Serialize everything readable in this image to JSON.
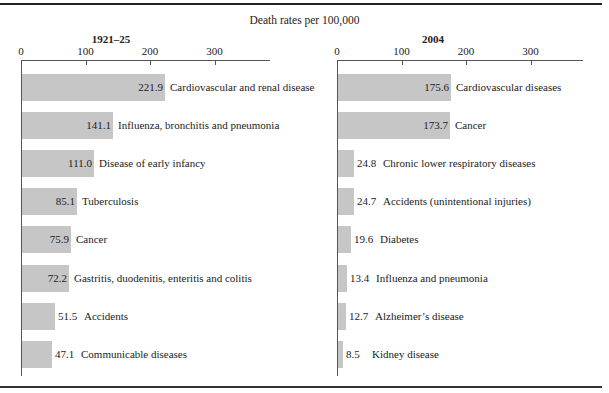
{
  "super_title": "Death rates per 100,000",
  "chart_data": [
    {
      "type": "bar",
      "orientation": "horizontal",
      "title": "1921–25",
      "xlabel": "Death rates per 100,000",
      "ylabel": "",
      "xlim": [
        0,
        380
      ],
      "xticks": [
        "0",
        "100",
        "200",
        "300"
      ],
      "grid": false,
      "categories": [
        "Cardiovascular and renal disease",
        "Influenza, bronchitis and pneumonia",
        "Disease of early infancy",
        "Tuberculosis",
        "Cancer",
        "Gastritis, duodenitis, enteritis and colitis",
        "Accidents",
        "Communicable diseases"
      ],
      "values": [
        221.9,
        141.1,
        111.0,
        85.1,
        75.9,
        72.2,
        51.5,
        47.1
      ],
      "value_labels": [
        "221.9",
        "141.1",
        "111.0",
        "85.1",
        "75.9",
        "72.2",
        "51.5",
        "47.1"
      ]
    },
    {
      "type": "bar",
      "orientation": "horizontal",
      "title": "2004",
      "xlabel": "Death rates per 100,000",
      "ylabel": "",
      "xlim": [
        0,
        380
      ],
      "xticks": [
        "0",
        "100",
        "200",
        "300"
      ],
      "grid": false,
      "categories": [
        "Cardiovascular diseases",
        "Cancer",
        "Chronic lower respiratory diseases",
        "Accidents (unintentional injuries)",
        "Diabetes",
        "Influenza and pneumonia",
        "Alzheimer’s disease",
        "Kidney disease"
      ],
      "values": [
        175.6,
        173.7,
        24.8,
        24.7,
        19.6,
        13.4,
        12.7,
        8.5
      ],
      "value_labels": [
        "175.6",
        "173.7",
        "24.8",
        "24.7",
        "19.6",
        "13.4",
        "12.7",
        "8.5"
      ]
    }
  ],
  "colors": {
    "bar": "#c6c6c6",
    "axis": "#555555",
    "rule": "#222222"
  }
}
